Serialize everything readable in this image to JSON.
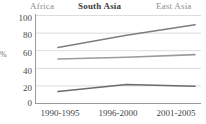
{
  "chart_data": {
    "type": "line",
    "title": "",
    "xlabel": "",
    "ylabel": "%",
    "ylim": [
      0,
      100
    ],
    "yticks": [
      0,
      20,
      40,
      60,
      80,
      100
    ],
    "grid": true,
    "legend_position": "top",
    "categories": [
      "1990-1995",
      "1996-2000",
      "2001-2005"
    ],
    "series": [
      {
        "name": "Africa",
        "values": [
          13,
          21,
          19
        ],
        "color": "#6b6b6b"
      },
      {
        "name": "South Asia",
        "values": [
          50,
          52,
          55
        ],
        "color": "#9b9b9b"
      },
      {
        "name": "East Asia",
        "values": [
          63,
          77,
          89
        ],
        "color": "#7d7d7d"
      }
    ]
  },
  "legend": {
    "items": [
      {
        "label": "Africa"
      },
      {
        "label": "South Asia"
      },
      {
        "label": "East Asia"
      }
    ]
  },
  "yaxis": {
    "title": "%",
    "ticks": [
      {
        "label": "100"
      },
      {
        "label": "80"
      },
      {
        "label": "60"
      },
      {
        "label": "40"
      },
      {
        "label": "20"
      },
      {
        "label": "0"
      }
    ]
  },
  "xaxis": {
    "ticks": [
      {
        "label": "1990-1995"
      },
      {
        "label": "1996-2000"
      },
      {
        "label": "2001-2005"
      }
    ]
  },
  "colors": {
    "gridline": "#dcdcdc",
    "axis": "#9a9a9a",
    "text": "#4a4a4a",
    "legend_muted": "#8c8c8c",
    "legend_emphasis": "#3c3c3c"
  }
}
